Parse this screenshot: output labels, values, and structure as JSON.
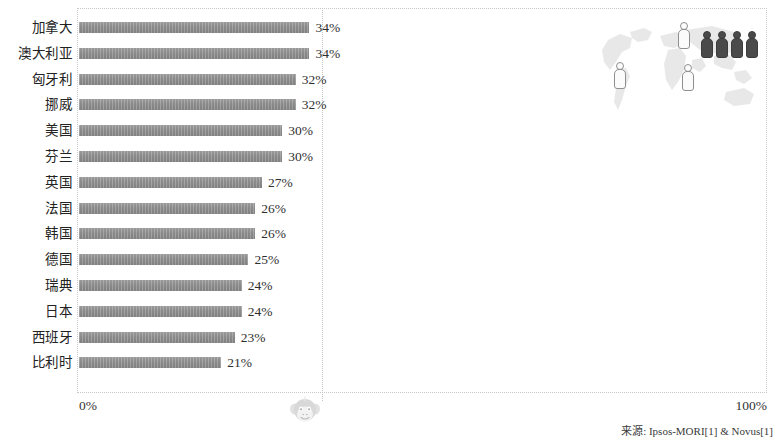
{
  "chart_data": {
    "type": "bar",
    "orientation": "horizontal",
    "title": "",
    "subtitle": "",
    "xlabel": "",
    "ylabel": "",
    "xlim": [
      0,
      100
    ],
    "xtick_labels": [
      "0%",
      "100%"
    ],
    "grid": true,
    "gridline_value": 50,
    "legend": null,
    "value_suffix": "%",
    "categories": [
      "加拿大",
      "澳大利亚",
      "匈牙利",
      "挪威",
      "美国",
      "芬兰",
      "英国",
      "法国",
      "韩国",
      "德国",
      "瑞典",
      "日本",
      "西班牙",
      "比利时"
    ],
    "values": [
      34,
      34,
      32,
      32,
      30,
      30,
      27,
      26,
      26,
      25,
      24,
      24,
      23,
      21
    ],
    "value_labels": [
      "34%",
      "34%",
      "32%",
      "32%",
      "30%",
      "30%",
      "27%",
      "26%",
      "26%",
      "25%",
      "24%",
      "24%",
      "23%",
      "21%"
    ],
    "bar_color": "#8a8a8a",
    "source_note": "来源: Ipsos-MORI[1] & Novus[1]"
  },
  "axis": {
    "left_tick": "0%",
    "right_tick": "100%"
  },
  "footer": {
    "source": "来源: Ipsos-MORI[1] & Novus[1]"
  },
  "decoration": {
    "map_icon": "world-map",
    "watermark_icon": "monkey-face",
    "figures_light_count": 3,
    "figures_dark_count": 4,
    "light_color": "#fbfbfb",
    "dark_color": "#4a4a4a"
  }
}
